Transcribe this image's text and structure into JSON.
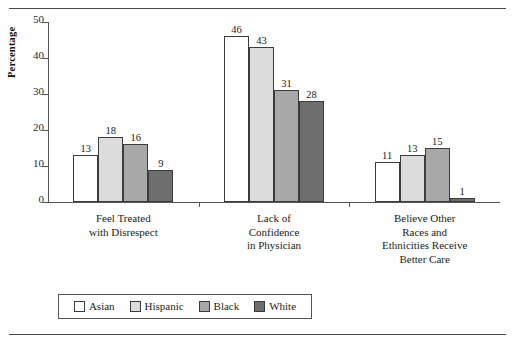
{
  "chart_data": {
    "type": "bar",
    "title": "",
    "xlabel": "",
    "ylabel": "Percentage",
    "ylim": [
      0,
      50
    ],
    "yticks": [
      0,
      10,
      20,
      30,
      40,
      50
    ],
    "grid": false,
    "legend_position": "bottom",
    "categories": [
      "Feel Treated\nwith Disrespect",
      "Lack of\nConfidence\nin Physician",
      "Believe Other\nRaces and\nEthnicities Receive\nBetter Care"
    ],
    "series": [
      {
        "name": "Asian",
        "color": "#ffffff",
        "values": [
          13,
          46,
          11
        ]
      },
      {
        "name": "Hispanic",
        "color": "#dcdcdc",
        "values": [
          18,
          43,
          13
        ]
      },
      {
        "name": "Black",
        "color": "#a8a8a8",
        "values": [
          16,
          31,
          15
        ]
      },
      {
        "name": "White",
        "color": "#6e6e6e",
        "values": [
          9,
          28,
          1
        ]
      }
    ]
  },
  "legend": {
    "items": [
      {
        "label": "Asian"
      },
      {
        "label": "Hispanic"
      },
      {
        "label": "Black"
      },
      {
        "label": "White"
      }
    ]
  }
}
